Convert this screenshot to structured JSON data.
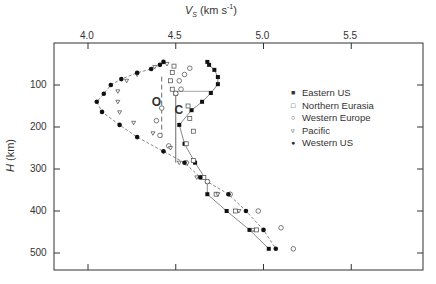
{
  "chart_data": {
    "type": "scatter",
    "title": "",
    "xlabel": "V_S (km s^-1)",
    "xlabel_main": "V",
    "xlabel_sub": "S",
    "xlabel_units": "(km s",
    "xlabel_sup": "-1",
    "xlabel_close": ")",
    "ylabel": "H (km)",
    "ylabel_var": "H",
    "ylabel_units": "(km)",
    "xlim": [
      3.81,
      5.91
    ],
    "ylim": [
      0,
      540
    ],
    "x_axis_position": "top",
    "y_inverted": true,
    "xticks": [
      4.0,
      4.5,
      5.0,
      5.5
    ],
    "xtick_labels": [
      "4.0",
      "4.5",
      "5.0",
      "5.5"
    ],
    "yticks": [
      100,
      200,
      300,
      400,
      500
    ],
    "ytick_labels": [
      "100",
      "200",
      "300",
      "400",
      "500"
    ],
    "grid": false,
    "legend_position": "right-center",
    "annotations": [
      {
        "text": "O",
        "x": 4.38,
        "y": 140
      },
      {
        "text": "C",
        "x": 4.51,
        "y": 160
      }
    ],
    "series": [
      {
        "name": "Eastern US",
        "marker": "filled-square",
        "points": [
          [
            4.68,
            45
          ],
          [
            4.69,
            52
          ],
          [
            4.72,
            64
          ],
          [
            4.74,
            81
          ],
          [
            4.74,
            98
          ],
          [
            4.7,
            119
          ],
          [
            4.65,
            140
          ],
          [
            4.59,
            160
          ],
          [
            4.52,
            195
          ],
          [
            4.55,
            240
          ],
          [
            4.61,
            285
          ],
          [
            4.68,
            330
          ],
          [
            4.68,
            360
          ],
          [
            4.79,
            400
          ],
          [
            4.92,
            445
          ],
          [
            5.03,
            490
          ]
        ]
      },
      {
        "name": "Northern Eurasia",
        "marker": "open-square",
        "points": [
          [
            4.49,
            55
          ],
          [
            4.48,
            70
          ],
          [
            4.47,
            90
          ],
          [
            4.48,
            110
          ],
          [
            4.5,
            120
          ],
          [
            4.57,
            150
          ],
          [
            4.58,
            180
          ],
          [
            4.6,
            210
          ],
          [
            4.56,
            240
          ],
          [
            4.6,
            280
          ],
          [
            4.66,
            320
          ],
          [
            4.73,
            360
          ],
          [
            4.84,
            400
          ],
          [
            4.96,
            445
          ]
        ]
      },
      {
        "name": "Western Europe",
        "marker": "open-circle",
        "points": [
          [
            4.58,
            60
          ],
          [
            4.55,
            75
          ],
          [
            4.52,
            90
          ],
          [
            4.53,
            110
          ],
          [
            4.5,
            120
          ],
          [
            4.42,
            155
          ],
          [
            4.39,
            185
          ],
          [
            4.41,
            220
          ],
          [
            4.46,
            245
          ],
          [
            4.56,
            285
          ],
          [
            4.68,
            330
          ],
          [
            4.81,
            360
          ],
          [
            4.97,
            400
          ],
          [
            5.1,
            440
          ],
          [
            5.17,
            490
          ]
        ]
      },
      {
        "name": "Pacific",
        "marker": "open-triangle",
        "points": [
          [
            4.45,
            50
          ],
          [
            4.38,
            57
          ],
          [
            4.28,
            75
          ],
          [
            4.22,
            90
          ],
          [
            4.17,
            115
          ],
          [
            4.17,
            140
          ],
          [
            4.18,
            165
          ],
          [
            4.26,
            190
          ],
          [
            4.37,
            215
          ],
          [
            4.47,
            250
          ],
          [
            4.52,
            285
          ],
          [
            4.62,
            320
          ],
          [
            4.74,
            360
          ],
          [
            4.86,
            400
          ],
          [
            4.94,
            445
          ]
        ]
      },
      {
        "name": "Western US",
        "marker": "filled-circle",
        "points": [
          [
            4.43,
            45
          ],
          [
            4.41,
            52
          ],
          [
            4.36,
            62
          ],
          [
            4.28,
            71
          ],
          [
            4.19,
            86
          ],
          [
            4.13,
            100
          ],
          [
            4.09,
            121
          ],
          [
            4.05,
            140
          ],
          [
            4.08,
            164
          ],
          [
            4.18,
            195
          ],
          [
            4.28,
            224
          ],
          [
            4.43,
            258
          ],
          [
            4.55,
            285
          ],
          [
            4.64,
            320
          ],
          [
            4.8,
            360
          ],
          [
            4.9,
            400
          ],
          [
            5.0,
            445
          ],
          [
            5.07,
            490
          ]
        ]
      }
    ]
  },
  "legend": {
    "items": [
      {
        "label": "Eastern US",
        "symbol": "■"
      },
      {
        "label": "Northern Eurasia",
        "symbol": "□"
      },
      {
        "label": "Western Europe",
        "symbol": "○"
      },
      {
        "label": "Pacific",
        "symbol": "▿"
      },
      {
        "label": "Western US",
        "symbol": "●"
      }
    ]
  }
}
